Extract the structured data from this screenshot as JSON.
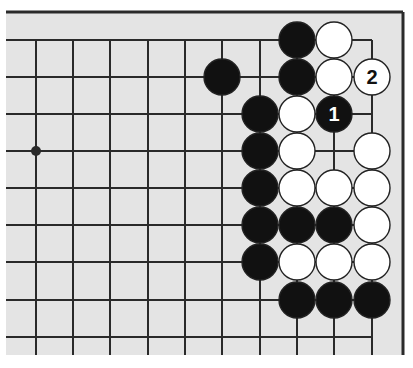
{
  "diagram": {
    "type": "go-board-fragment",
    "colors": {
      "board": "#e4e4e4",
      "line": "#2a2a2a",
      "black_stone": "#111111",
      "white_stone": "#ffffff",
      "stone_outline": "#222222"
    },
    "grid": {
      "columns_x": [
        36,
        73,
        110,
        148,
        185,
        222,
        260,
        297,
        334,
        372
      ],
      "rows_y": [
        40,
        77,
        114,
        151,
        188,
        225,
        262,
        300,
        337
      ],
      "top_edge_y": 12,
      "right_edge_x": 403,
      "bottom_extent_y": 355
    },
    "star_points": [
      {
        "col": 0,
        "row": 3
      }
    ],
    "stones": [
      {
        "color": "black",
        "col": 7,
        "row": 0,
        "label": ""
      },
      {
        "color": "white",
        "col": 8,
        "row": 0,
        "label": ""
      },
      {
        "color": "black",
        "col": 5,
        "row": 1,
        "label": ""
      },
      {
        "color": "black",
        "col": 7,
        "row": 1,
        "label": ""
      },
      {
        "color": "white",
        "col": 8,
        "row": 1,
        "label": ""
      },
      {
        "color": "white",
        "col": 9,
        "row": 1,
        "label": "2"
      },
      {
        "color": "black",
        "col": 6,
        "row": 2,
        "label": ""
      },
      {
        "color": "white",
        "col": 7,
        "row": 2,
        "label": ""
      },
      {
        "color": "black",
        "col": 8,
        "row": 2,
        "label": "1"
      },
      {
        "color": "black",
        "col": 6,
        "row": 3,
        "label": ""
      },
      {
        "color": "white",
        "col": 7,
        "row": 3,
        "label": ""
      },
      {
        "color": "white",
        "col": 9,
        "row": 3,
        "label": ""
      },
      {
        "color": "black",
        "col": 6,
        "row": 4,
        "label": ""
      },
      {
        "color": "white",
        "col": 7,
        "row": 4,
        "label": ""
      },
      {
        "color": "white",
        "col": 8,
        "row": 4,
        "label": ""
      },
      {
        "color": "white",
        "col": 9,
        "row": 4,
        "label": ""
      },
      {
        "color": "black",
        "col": 6,
        "row": 5,
        "label": ""
      },
      {
        "color": "black",
        "col": 7,
        "row": 5,
        "label": ""
      },
      {
        "color": "black",
        "col": 8,
        "row": 5,
        "label": ""
      },
      {
        "color": "white",
        "col": 9,
        "row": 5,
        "label": ""
      },
      {
        "color": "black",
        "col": 6,
        "row": 6,
        "label": ""
      },
      {
        "color": "white",
        "col": 7,
        "row": 6,
        "label": ""
      },
      {
        "color": "white",
        "col": 8,
        "row": 6,
        "label": ""
      },
      {
        "color": "white",
        "col": 9,
        "row": 6,
        "label": ""
      },
      {
        "color": "black",
        "col": 7,
        "row": 7,
        "label": ""
      },
      {
        "color": "black",
        "col": 8,
        "row": 7,
        "label": ""
      },
      {
        "color": "black",
        "col": 9,
        "row": 7,
        "label": ""
      }
    ],
    "move_labels": [
      "1",
      "2"
    ]
  }
}
